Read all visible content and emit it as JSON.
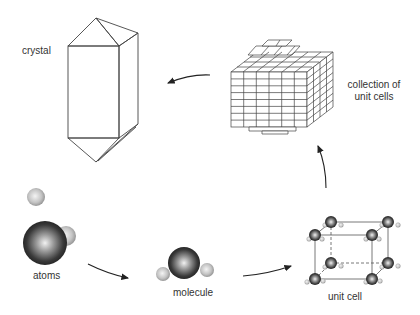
{
  "diagram": {
    "labels": {
      "crystal": "crystal",
      "collection_line1": "collection of",
      "collection_line2": "unit cells",
      "atoms": "atoms",
      "molecule": "molecule",
      "unit_cell": "unit cell"
    },
    "flow": [
      "atoms",
      "molecule",
      "unit cell",
      "collection of unit cells",
      "crystal"
    ],
    "colors": {
      "line": "#444444",
      "atom_dark": "#2a2a2a",
      "atom_light": "#bdbdbd",
      "text": "#333333"
    }
  }
}
